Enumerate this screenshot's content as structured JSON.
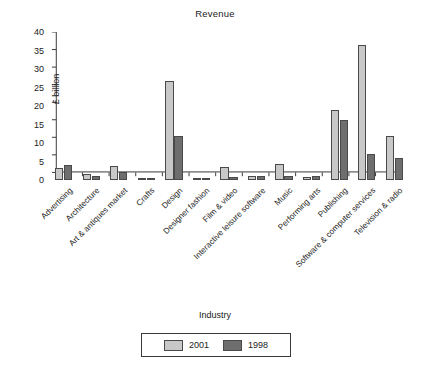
{
  "chart_data": {
    "type": "bar",
    "title": "Revenue",
    "xlabel": "Industry",
    "ylabel": "£ billion",
    "ylim": [
      0,
      40
    ],
    "yticks": [
      0,
      5,
      10,
      15,
      20,
      25,
      30,
      35,
      40
    ],
    "grid": false,
    "legend_position": "bottom",
    "categories": [
      "Advertising",
      "Architecture",
      "Art & antiques market",
      "Crafts",
      "Design",
      "Designer fashion",
      "Film & video",
      "Interactive leisure software",
      "Music",
      "Performing arts",
      "Publishing",
      "Software & computer services",
      "Television & radio"
    ],
    "series": [
      {
        "name": "2001",
        "color": "#c8c8c8",
        "values": [
          3.2,
          1.5,
          3.8,
          0.4,
          26.7,
          0.6,
          3.6,
          1.0,
          4.3,
          0.9,
          18.9,
          36.4,
          12.0
        ]
      },
      {
        "name": "1998",
        "color": "#6e6e6e",
        "values": [
          4.0,
          1.1,
          2.2,
          0.4,
          12.0,
          0.6,
          0.8,
          1.2,
          1.0,
          1.0,
          16.3,
          7.0,
          5.9
        ]
      }
    ]
  }
}
